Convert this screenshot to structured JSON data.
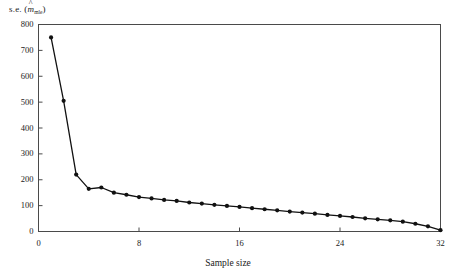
{
  "figure": {
    "ylabel_prefix": "s.e. (",
    "ylabel_symbol": "m",
    "ylabel_hat": "^",
    "ylabel_subscript": "mle",
    "ylabel_suffix": ")",
    "xlabel": "Sample size"
  },
  "chart_data": {
    "type": "line",
    "title": "",
    "xlabel": "Sample size",
    "ylabel": "s.e. (m̂mle)",
    "xlim": [
      0,
      32
    ],
    "ylim": [
      0,
      800
    ],
    "xticks": [
      0,
      8,
      16,
      24,
      32
    ],
    "yticks": [
      0,
      100,
      200,
      300,
      400,
      500,
      600,
      700,
      800
    ],
    "grid": false,
    "legend": null,
    "marker": "filled-circle",
    "line_color": "#111111",
    "marker_color": "#111111",
    "x": [
      1,
      2,
      3,
      4,
      5,
      6,
      7,
      8,
      9,
      10,
      11,
      12,
      13,
      14,
      15,
      16,
      17,
      18,
      19,
      20,
      21,
      22,
      23,
      24,
      25,
      26,
      27,
      28,
      29,
      30,
      31,
      32
    ],
    "values": [
      750,
      505,
      220,
      165,
      170,
      150,
      142,
      133,
      128,
      122,
      118,
      112,
      108,
      103,
      99,
      95,
      90,
      86,
      82,
      77,
      73,
      69,
      64,
      60,
      56,
      51,
      47,
      43,
      38,
      30,
      20,
      5
    ]
  },
  "axis_ticks": {
    "y": [
      {
        "label": "800",
        "value": 800
      },
      {
        "label": "700",
        "value": 700
      },
      {
        "label": "600",
        "value": 600
      },
      {
        "label": "500",
        "value": 500
      },
      {
        "label": "400",
        "value": 400
      },
      {
        "label": "300",
        "value": 300
      },
      {
        "label": "200",
        "value": 200
      },
      {
        "label": "100",
        "value": 100
      },
      {
        "label": "0",
        "value": 0
      }
    ],
    "x": [
      {
        "label": "0",
        "value": 0
      },
      {
        "label": "8",
        "value": 8
      },
      {
        "label": "16",
        "value": 16
      },
      {
        "label": "24",
        "value": 24
      },
      {
        "label": "32",
        "value": 32
      }
    ]
  }
}
